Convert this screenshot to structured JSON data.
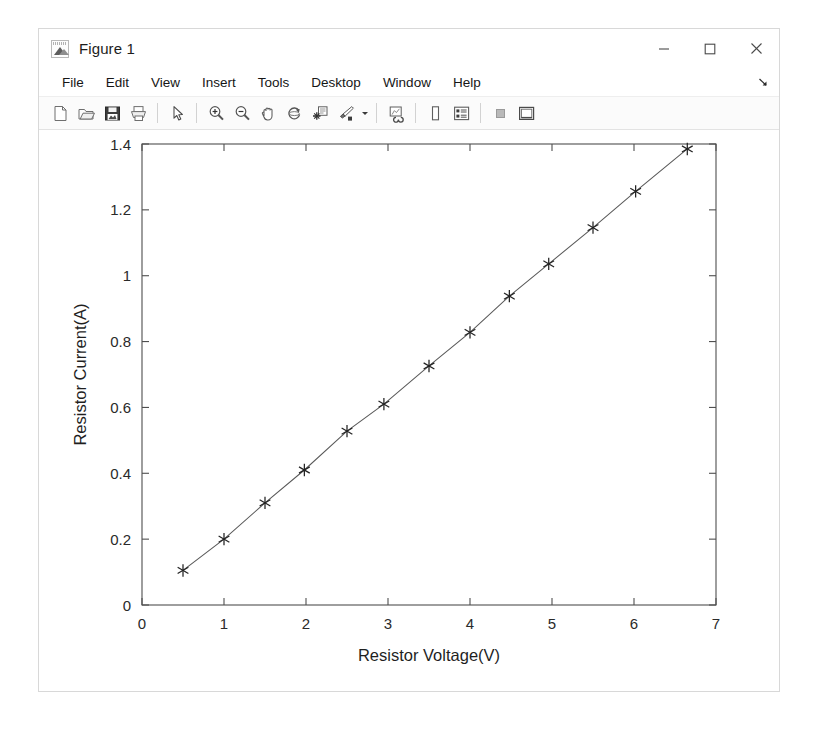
{
  "window": {
    "title": "Figure 1",
    "icon": "matlab-figure-icon",
    "controls": [
      {
        "name": "minimize-button",
        "glyph": "minimize"
      },
      {
        "name": "maximize-button",
        "glyph": "maximize"
      },
      {
        "name": "close-button",
        "glyph": "close"
      }
    ]
  },
  "menubar": {
    "items": [
      {
        "label": "File"
      },
      {
        "label": "Edit"
      },
      {
        "label": "View"
      },
      {
        "label": "Insert"
      },
      {
        "label": "Tools"
      },
      {
        "label": "Desktop"
      },
      {
        "label": "Window"
      },
      {
        "label": "Help"
      }
    ],
    "overflow_icon": "menu-overflow-arrow-icon"
  },
  "toolbar": {
    "buttons": [
      {
        "name": "new-figure-icon",
        "title": "New Figure"
      },
      {
        "name": "open-file-icon",
        "title": "Open File"
      },
      {
        "name": "save-figure-icon",
        "title": "Save Figure"
      },
      {
        "name": "print-figure-icon",
        "title": "Print Figure"
      },
      {
        "name": "separator-1",
        "title": ""
      },
      {
        "name": "edit-pointer-icon",
        "title": "Edit Plot"
      },
      {
        "name": "separator-2",
        "title": ""
      },
      {
        "name": "zoom-in-icon",
        "title": "Zoom In"
      },
      {
        "name": "zoom-out-icon",
        "title": "Zoom Out"
      },
      {
        "name": "pan-hand-icon",
        "title": "Pan"
      },
      {
        "name": "rotate-3d-icon",
        "title": "Rotate 3D"
      },
      {
        "name": "data-cursor-icon",
        "title": "Data Cursor"
      },
      {
        "name": "brush-select-icon",
        "title": "Brush/Select Data"
      },
      {
        "name": "brush-dropdown-caret-icon",
        "title": ""
      },
      {
        "name": "separator-3",
        "title": ""
      },
      {
        "name": "link-plot-icon",
        "title": "Link Plot"
      },
      {
        "name": "separator-4",
        "title": ""
      },
      {
        "name": "insert-colorbar-icon",
        "title": "Insert Colorbar"
      },
      {
        "name": "insert-legend-icon",
        "title": "Insert Legend"
      },
      {
        "name": "separator-5",
        "title": ""
      },
      {
        "name": "plot-browser-icon",
        "title": "Hide Plot Tools"
      },
      {
        "name": "figure-palette-icon",
        "title": "Show Plot Tools and Dock Figure"
      }
    ]
  },
  "chart_data": {
    "type": "line",
    "title": "",
    "xlabel": "Resistor Voltage(V)",
    "ylabel": "Resistor Current(A)",
    "xlim": [
      0,
      7
    ],
    "ylim": [
      0,
      1.4
    ],
    "xticks": [
      0,
      1,
      2,
      3,
      4,
      5,
      6,
      7
    ],
    "xticklabels": [
      "0",
      "1",
      "2",
      "3",
      "4",
      "5",
      "6",
      "7"
    ],
    "yticks": [
      0,
      0.2,
      0.4,
      0.6,
      0.8,
      1,
      1.2,
      1.4
    ],
    "yticklabels": [
      "0",
      "0.2",
      "0.4",
      "0.6",
      "0.8",
      "1",
      "1.2",
      "1.4"
    ],
    "grid": false,
    "legend": null,
    "box": true,
    "tick_direction": "in",
    "marker": "asterisk",
    "line_color": "#595959",
    "marker_color": "#232323",
    "series": [
      {
        "name": "measured",
        "x": [
          0.5,
          1.0,
          1.5,
          1.98,
          2.5,
          2.95,
          3.5,
          4.0,
          4.48,
          4.96,
          5.5,
          6.02,
          6.65
        ],
        "y": [
          0.105,
          0.2,
          0.31,
          0.41,
          0.528,
          0.61,
          0.726,
          0.828,
          0.938,
          1.036,
          1.146,
          1.256,
          1.385
        ]
      }
    ]
  }
}
